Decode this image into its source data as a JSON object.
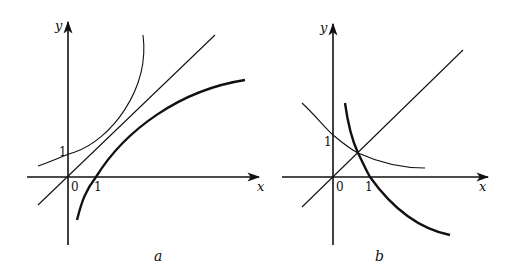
{
  "figure": {
    "panels": [
      {
        "id": "a",
        "caption": "a",
        "axes": {
          "x_label": "x",
          "y_label": "y",
          "origin_label": "0",
          "x_tick_label": "1",
          "y_tick_label": "1"
        },
        "curves": [
          {
            "name": "exponential-base-gt-1",
            "description": "y = a^x, a > 1",
            "weight": "thin"
          },
          {
            "name": "identity-line",
            "description": "y = x",
            "weight": "thin"
          },
          {
            "name": "logarithm-base-gt-1",
            "description": "y = log_a x, a > 1",
            "weight": "thick"
          }
        ]
      },
      {
        "id": "b",
        "caption": "b",
        "axes": {
          "x_label": "x",
          "y_label": "y",
          "origin_label": "0",
          "x_tick_label": "1",
          "y_tick_label": "1"
        },
        "curves": [
          {
            "name": "exponential-base-lt-1",
            "description": "y = a^x, 0 < a < 1",
            "weight": "thin"
          },
          {
            "name": "identity-line",
            "description": "y = x",
            "weight": "thin"
          },
          {
            "name": "logarithm-base-lt-1",
            "description": "y = log_a x, 0 < a < 1",
            "weight": "thick"
          }
        ]
      }
    ]
  }
}
